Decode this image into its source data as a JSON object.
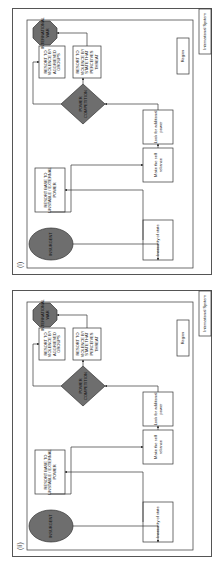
{
  "figure": {
    "panels": [
      {
        "id_label": "(i)",
        "outer_box_label": "International System",
        "inner_box_label": "Region",
        "nodes": {
          "insurgent": "INSURGENT",
          "resort_external": [
            "RESORT BASE TO",
            "UNSTABLE / EXTERNAL",
            "POWER"
          ],
          "insecurity": [
            "Insecurity of state"
          ],
          "self_reliance": [
            "Make the self",
            "reliance"
          ],
          "additional_power": [
            "Look for additional",
            "power"
          ],
          "power_competition": [
            "POWER",
            "COMPETITION"
          ],
          "violence_groups": [
            "RESORT TO",
            "VIOLENCE BY",
            "AGGRIEVED",
            "GROUPS"
          ],
          "violence_state": [
            "RESORT TO",
            "VIOLENCE BY",
            "STATE THAT",
            "PERCEIVES",
            "THREAT"
          ],
          "international_war": [
            "INTERNATIONAL",
            "WAR"
          ]
        }
      },
      {
        "id_label": "(ii)",
        "outer_box_label": "International System",
        "inner_box_label": "Region",
        "nodes": {
          "insurgent": "INSURGENT",
          "resort_external": [
            "RESORT BASE TO",
            "UNSTABLE / EXTERNAL",
            "POWER"
          ],
          "insecurity": [
            "Insecurity of state"
          ],
          "self_reliance": [
            "Make the self",
            "reliance"
          ],
          "additional_power": [
            "Look for additional",
            "power"
          ],
          "power_competition": [
            "POWER",
            "COMPETITION"
          ],
          "violence_groups": [
            "RESORT TO",
            "VIOLENCE BY",
            "AGGRIEVED",
            "GROUPS"
          ],
          "violence_state": [
            "RESORT TO",
            "VIOLENCE BY",
            "STATE THAT",
            "PERCEIVES",
            "THREAT"
          ],
          "international_war": [
            "INTERNATIONAL",
            "WAR"
          ]
        }
      }
    ],
    "colors": {
      "shape_fill": "#6e6e6e",
      "box_fill": "#ffffff",
      "line": "#333333"
    }
  }
}
